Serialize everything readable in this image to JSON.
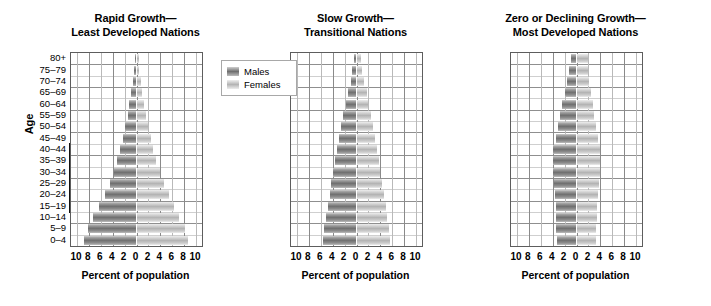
{
  "axis": {
    "y_title": "Age",
    "age_groups": [
      "80+",
      "75–79",
      "70–74",
      "65–69",
      "60–64",
      "55–59",
      "50–54",
      "45–49",
      "40–44",
      "35–39",
      "30–34",
      "25–29",
      "20–24",
      "15–19",
      "10–14",
      "5–9",
      "0–4"
    ],
    "x_title": "Percent of population",
    "x_ticks": [
      "10",
      "8",
      "6",
      "4",
      "2",
      "0",
      "2",
      "4",
      "6",
      "8",
      "10"
    ],
    "x_tick_values": [
      -10,
      -8,
      -6,
      -4,
      -2,
      0,
      2,
      4,
      6,
      8,
      10
    ],
    "x_min": -11,
    "x_max": 11
  },
  "legend": {
    "males_label": "Males",
    "females_label": "Females",
    "males_color": "#6f6f6f",
    "females_color": "#b4b4b4"
  },
  "annotation": {
    "repro_line1": "Reproductive",
    "repro_line2": "years",
    "bracket_from": "15–19",
    "bracket_to": "40–44"
  },
  "chart_data": {
    "type": "bar",
    "subtype": "population-pyramid",
    "xlabel": "Percent of population",
    "ylabel": "Age",
    "xlim": [
      -11,
      11
    ],
    "grid": true,
    "legend_position": "top-center-left-panel",
    "categories": [
      "80+",
      "75–79",
      "70–74",
      "65–69",
      "60–64",
      "55–59",
      "50–54",
      "45–49",
      "40–44",
      "35–39",
      "30–34",
      "25–29",
      "20–24",
      "15–19",
      "10–14",
      "5–9",
      "0–4"
    ],
    "panels": [
      {
        "title_line1": "Rapid Growth—",
        "title_line2": "Least Developed Nations",
        "series": [
          {
            "name": "Males",
            "values": [
              0.3,
              0.4,
              0.6,
              0.9,
              1.2,
              1.5,
              1.9,
              2.3,
              2.7,
              3.2,
              3.8,
              4.5,
              5.3,
              6.3,
              7.3,
              8.2,
              8.9
            ]
          },
          {
            "name": "Females",
            "values": [
              0.4,
              0.5,
              0.7,
              1.0,
              1.3,
              1.6,
              2.0,
              2.4,
              2.8,
              3.3,
              3.9,
              4.6,
              5.4,
              6.3,
              7.2,
              8.1,
              8.7
            ]
          }
        ]
      },
      {
        "title_line1": "Slow Growth—",
        "title_line2": "Transitional Nations",
        "series": [
          {
            "name": "Males",
            "values": [
              0.5,
              0.7,
              1.0,
              1.4,
              1.8,
              2.2,
              2.6,
              3.0,
              3.3,
              3.6,
              3.9,
              4.2,
              4.5,
              4.8,
              5.1,
              5.4,
              5.7
            ]
          },
          {
            "name": "Females",
            "values": [
              0.8,
              1.0,
              1.3,
              1.7,
              2.0,
              2.4,
              2.8,
              3.1,
              3.4,
              3.7,
              4.0,
              4.3,
              4.6,
              4.9,
              5.1,
              5.4,
              5.6
            ]
          }
        ]
      },
      {
        "title_line1": "Zero or Declining Growth—",
        "title_line2": "Most Developed Nations",
        "series": [
          {
            "name": "Males",
            "values": [
              1.0,
              1.3,
              1.6,
              2.0,
              2.4,
              2.7,
              3.1,
              3.5,
              3.9,
              4.0,
              3.9,
              3.7,
              3.6,
              3.5,
              3.5,
              3.4,
              3.3
            ]
          },
          {
            "name": "Females",
            "values": [
              1.9,
              2.0,
              2.1,
              2.4,
              2.7,
              3.0,
              3.3,
              3.6,
              3.9,
              4.0,
              3.9,
              3.7,
              3.6,
              3.5,
              3.4,
              3.3,
              3.2
            ]
          }
        ]
      }
    ]
  }
}
